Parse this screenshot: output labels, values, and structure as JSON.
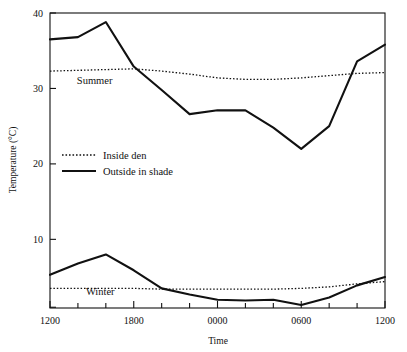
{
  "chart_data": {
    "type": "line",
    "title": "",
    "xlabel": "Time",
    "ylabel": "Temperature (°C)",
    "xtick_labels": [
      "1200",
      "1800",
      "0000",
      "0600",
      "1200"
    ],
    "xtick_hours": [
      0,
      6,
      12,
      18,
      24
    ],
    "xminor_step_hours": 2,
    "ytick_labels": [
      "10",
      "20",
      "30",
      "40"
    ],
    "ytick_values": [
      10,
      20,
      30,
      40
    ],
    "ylim": [
      0.9,
      40
    ],
    "xlim_hours": [
      0,
      24
    ],
    "grid": "off",
    "legend_position": "center-left inside axes",
    "legend": [
      {
        "label": "Inside den",
        "style": "dotted"
      },
      {
        "label": "Outside in shade",
        "style": "solid"
      }
    ],
    "group_annotations": [
      {
        "label": "Summer",
        "x_hours": 3.2,
        "y_value": 30.6
      },
      {
        "label": "Winter",
        "x_hours": 3.6,
        "y_value": 2.6
      }
    ],
    "series": [
      {
        "name": "Summer – Outside in shade",
        "group": "Summer",
        "style": "solid",
        "color": "#111111",
        "x_hours": [
          0,
          2,
          4,
          6,
          8,
          10,
          12,
          14,
          16,
          18,
          20,
          22,
          24
        ],
        "values": [
          36.5,
          36.8,
          38.8,
          32.9,
          29.8,
          26.6,
          27.1,
          27.1,
          24.8,
          22.0,
          25.0,
          33.6,
          35.8
        ]
      },
      {
        "name": "Summer – Inside den",
        "group": "Summer",
        "style": "dotted",
        "color": "#111111",
        "x_hours": [
          0,
          2,
          4,
          6,
          8,
          10,
          12,
          14,
          16,
          18,
          20,
          22,
          24
        ],
        "values": [
          32.3,
          32.4,
          32.5,
          32.6,
          32.3,
          31.9,
          31.4,
          31.2,
          31.2,
          31.4,
          31.7,
          32.0,
          32.1
        ]
      },
      {
        "name": "Winter – Outside in shade",
        "group": "Winter",
        "style": "solid",
        "color": "#111111",
        "x_hours": [
          0,
          2,
          4,
          6,
          8,
          10,
          12,
          14,
          16,
          18,
          20,
          22,
          24
        ],
        "values": [
          5.3,
          6.8,
          8.0,
          5.9,
          3.5,
          2.7,
          2.0,
          1.9,
          2.0,
          1.3,
          2.3,
          3.9,
          5.0
        ]
      },
      {
        "name": "Winter – Inside den",
        "group": "Winter",
        "style": "dotted",
        "color": "#111111",
        "x_hours": [
          0,
          2,
          4,
          6,
          8,
          10,
          12,
          14,
          16,
          18,
          20,
          22,
          24
        ],
        "values": [
          3.5,
          3.5,
          3.5,
          3.5,
          3.4,
          3.4,
          3.4,
          3.4,
          3.4,
          3.5,
          3.7,
          4.1,
          4.4
        ]
      }
    ]
  }
}
